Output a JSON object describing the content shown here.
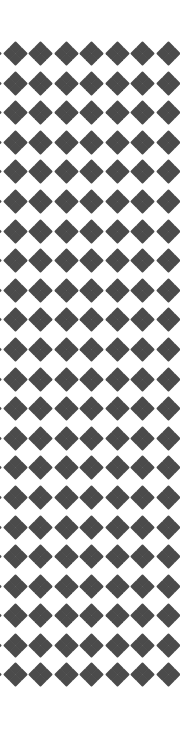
{
  "page": {
    "kind": "decorative-pattern-page",
    "width": 180,
    "height": 745,
    "background_color": "#ffffff"
  },
  "pattern": {
    "name": "quatrefoil-diamond-lattice",
    "motif_name": "quatrefoil",
    "motif_shape": "diamond",
    "diamonds_per_motif": 4,
    "fill_color": "#4b4b4b",
    "background_color": "#ffffff",
    "columns": 8,
    "rows": 22,
    "column_spacing_px": 25.5,
    "row_spacing_px": 29.6,
    "diamond_size_px": 9,
    "offset_left_px": -22,
    "offset_top_px": 43,
    "top_margin_px": 43,
    "bottom_margin_px": 30,
    "left_edge_clipped": true,
    "right_margin_px": 8
  },
  "accessibility": {
    "description": "Repeating ornamental border strip of dark gray four-diamond quatrefoil motifs on a white background, with the leftmost column clipped at the page edge."
  }
}
